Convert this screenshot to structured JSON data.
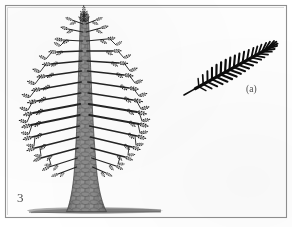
{
  "figure": {
    "kind": "scanned-botanical-illustration",
    "caption_number": "3",
    "part_label": "(a)",
    "background_color": "#fdfdfd",
    "border_color": "#8b8b8b",
    "ink_color": "#1a1a1a",
    "bark_color": "#8e8e8e",
    "ground_color": "#7e7e7e"
  },
  "border": {
    "name": "figure-frame",
    "x": 5,
    "y": 5,
    "width": 282,
    "height": 213
  },
  "tree": {
    "name": "conifer-tree",
    "description": "Conifer-like tree with scaly bark trunk and whorled branches",
    "apex_x": 82,
    "apex_y": 12,
    "base_x": 87,
    "base_y": 212,
    "crown_left": 30,
    "crown_right": 142,
    "trunk_top_width": 3.5,
    "trunk_base_width": 26,
    "whorl_count": 16
  },
  "frond": {
    "name": "pinnate-frond",
    "description": "Detached pinnate frond with leaflets along a central rachis",
    "stalk_x": 184,
    "stalk_y": 95,
    "tip_x": 273,
    "tip_y": 49,
    "angle_deg": -27,
    "pinnae_pairs": 19
  },
  "ground": {
    "name": "ground-shadow",
    "x_start": 28,
    "x_end": 162,
    "y": 210
  }
}
